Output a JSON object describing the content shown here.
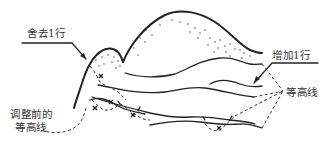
{
  "diagram": {
    "type": "contour-line-adjustment",
    "labels": {
      "remove_row": "舍去1行",
      "add_row": "增加1行",
      "before_adjustment_line1": "调整前的",
      "before_adjustment_line2": "等高线",
      "contour_lines": "等高线"
    },
    "elements": {
      "mountain_peaks": 2,
      "contour_lines_solid": 5,
      "old_contours_dashed_with_x_marks": true,
      "markers": "x"
    },
    "colors": {
      "ink": "#222222",
      "background": "#ffffff"
    }
  }
}
